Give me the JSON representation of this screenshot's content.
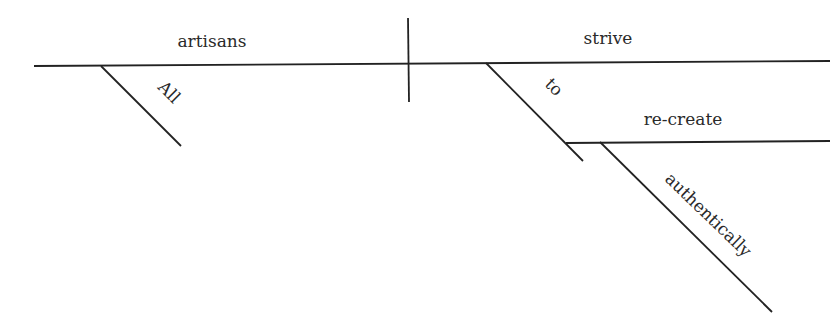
{
  "diagram": {
    "type": "sentence-diagram",
    "sentence": "All artisans strive to re-create authentically",
    "subject": "artisans",
    "verb": "strive",
    "modifiers": {
      "subject_modifier": "All",
      "infinitive_marker": "to",
      "infinitive_verb": "re-create",
      "adverb": "authentically"
    },
    "line_color": "#222222",
    "text_color": "#2a2a2a",
    "background": "#ffffff"
  }
}
